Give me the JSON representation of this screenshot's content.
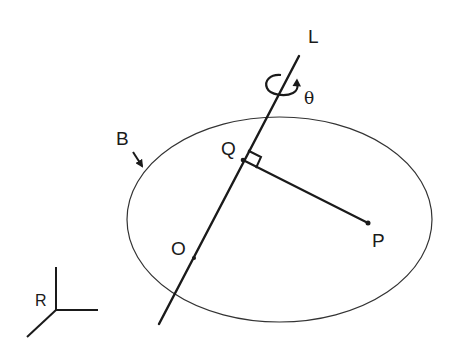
{
  "diagram": {
    "type": "rigid-body rotation about axis",
    "labels": {
      "axis": "L",
      "angle": "θ",
      "body": "B",
      "foot_point": "Q",
      "point": "P",
      "origin": "O",
      "frame": "R"
    },
    "elements": [
      {
        "id": "body-B",
        "shape": "ellipse",
        "description": "Rigid body B outline"
      },
      {
        "id": "axis-L",
        "shape": "line",
        "description": "Rotation axis L passing through O and Q"
      },
      {
        "id": "rotation-arrow",
        "shape": "curved arrow",
        "description": "Rotation by angle θ about L"
      },
      {
        "id": "segment-QP",
        "shape": "line",
        "description": "Perpendicular from P to axis L, meeting at Q"
      },
      {
        "id": "right-angle-marker",
        "shape": "square",
        "description": "Right angle at Q"
      },
      {
        "id": "frame-R",
        "shape": "axes",
        "description": "Reference frame R with three axes"
      }
    ],
    "colors": {
      "stroke": "#1a1a1a",
      "ellipse_stroke": "#333333",
      "background": "#ffffff"
    }
  }
}
